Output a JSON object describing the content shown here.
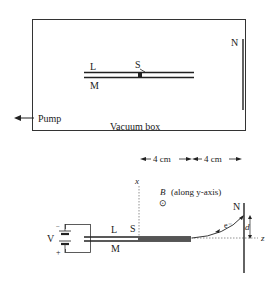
{
  "top_figure": {
    "box_label": "Vacuum box",
    "pump_label": "Pump",
    "plate_upper": "L",
    "plate_lower": "M",
    "source": "S",
    "screen": "N"
  },
  "bottom_figure": {
    "dim_left": "4 cm",
    "dim_right": "4 cm",
    "x_axis": "x",
    "z_axis": "z",
    "field_symbol": "B",
    "field_note": "(along y-axis)",
    "field_glyph": "⊙",
    "voltage": "V",
    "minus": "−",
    "plus": "+",
    "plate_upper": "L",
    "plate_lower": "M",
    "source": "S",
    "screen": "N",
    "electron": "e⁻",
    "deflection": "d"
  },
  "colors": {
    "ink": "#222222",
    "dotted": "#777777",
    "background": "#ffffff"
  }
}
